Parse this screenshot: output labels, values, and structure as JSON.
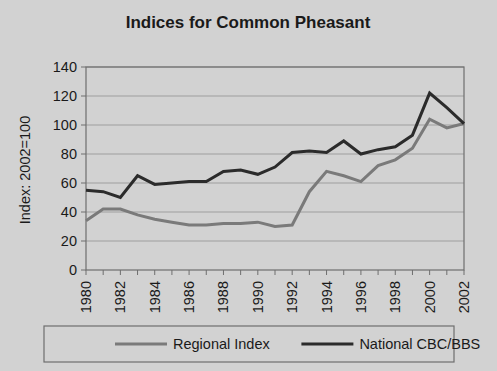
{
  "figure": {
    "background_color": "#d2d2d2",
    "plot_background_color": "#d2d2d2",
    "border_color": "#6e6e6e"
  },
  "chart_data": {
    "type": "line",
    "title": "Indices for Common Pheasant",
    "xlabel": "",
    "ylabel": "Index: 2002=100",
    "xlim": [
      1980,
      2002
    ],
    "ylim": [
      0,
      140
    ],
    "yticks": [
      0,
      20,
      40,
      60,
      80,
      100,
      120,
      140
    ],
    "ytick_labels": [
      "0",
      "20",
      "40",
      "60",
      "80",
      "100",
      "120",
      "140"
    ],
    "xticks": [
      1980,
      1981,
      1982,
      1983,
      1984,
      1985,
      1986,
      1987,
      1988,
      1989,
      1990,
      1991,
      1992,
      1993,
      1994,
      1995,
      1996,
      1997,
      1998,
      1999,
      2000,
      2001,
      2002
    ],
    "xtick_labels": [
      "1980",
      "",
      "1982",
      "",
      "1984",
      "",
      "1986",
      "",
      "1988",
      "",
      "1990",
      "",
      "1992",
      "",
      "1994",
      "",
      "1996",
      "",
      "1998",
      "",
      "2000",
      "",
      "2002"
    ],
    "grid": true,
    "grid_axis": "y",
    "legend_position": "bottom",
    "x": [
      1980,
      1981,
      1982,
      1983,
      1984,
      1985,
      1986,
      1987,
      1988,
      1989,
      1990,
      1991,
      1992,
      1993,
      1994,
      1995,
      1996,
      1997,
      1998,
      1999,
      2000,
      2001,
      2002
    ],
    "series": [
      {
        "name": "Regional Index",
        "color": "#7a7a7a",
        "line_width": 3,
        "values": [
          34,
          42,
          42,
          38,
          35,
          33,
          31,
          31,
          32,
          32,
          33,
          30,
          31,
          54,
          68,
          65,
          61,
          72,
          76,
          84,
          104,
          98,
          101
        ]
      },
      {
        "name": "National CBC/BBS",
        "color": "#2b2b2b",
        "line_width": 3,
        "values": [
          55,
          54,
          50,
          65,
          59,
          60,
          61,
          61,
          68,
          69,
          66,
          71,
          81,
          82,
          81,
          89,
          80,
          83,
          85,
          93,
          122,
          112,
          101
        ]
      }
    ]
  },
  "legend": {
    "items": [
      {
        "label": "Regional Index",
        "color": "#7a7a7a"
      },
      {
        "label": "National CBC/BBS",
        "color": "#2b2b2b"
      }
    ]
  }
}
